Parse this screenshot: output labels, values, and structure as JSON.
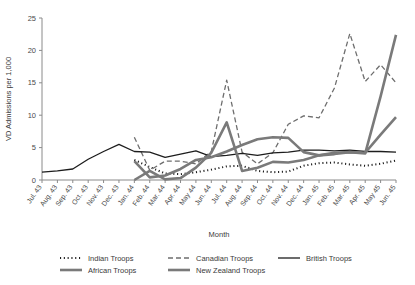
{
  "chart_data": {
    "type": "line",
    "title": "",
    "xlabel": "Month",
    "ylabel": "VD Admissions per 1,000",
    "ylim": [
      0,
      25
    ],
    "yticks": [
      0,
      5,
      10,
      15,
      20,
      25
    ],
    "grid": false,
    "legend_position": "bottom",
    "categories": [
      "Jul. 43",
      "Aug. 43",
      "Sep. 43",
      "Oct. 43",
      "Nov. 43",
      "Dec. 43",
      "Jan. 44",
      "Feb. 44",
      "Mar. 44",
      "Apr. 44",
      "May 44",
      "Jun. 44",
      "Jul. 44",
      "Aug. 44",
      "Sep. 44",
      "Oct. 44",
      "Nov. 44",
      "Dec. 44",
      "Jan. 45",
      "Feb. 45",
      "Mar. 45",
      "Apr. 45",
      "May 45",
      "Jun. 45"
    ],
    "series": [
      {
        "name": "Indian Troops",
        "style": "dotted",
        "color": "#1d1d1d",
        "width": 2,
        "values": [
          null,
          null,
          null,
          null,
          null,
          null,
          3.1,
          2.0,
          1.0,
          0.9,
          1.2,
          1.6,
          2.1,
          2.2,
          1.4,
          1.2,
          1.3,
          2.2,
          2.6,
          2.7,
          2.4,
          2.2,
          2.5,
          3.0
        ]
      },
      {
        "name": "Canadian Troops",
        "style": "dashed",
        "color": "#6e6e6e",
        "width": 1.3,
        "values": [
          null,
          null,
          null,
          null,
          null,
          null,
          6.6,
          1.5,
          2.9,
          2.9,
          2.5,
          4.4,
          15.4,
          4.3,
          2.5,
          4.2,
          8.6,
          9.9,
          9.6,
          14.2,
          22.6,
          15.2,
          17.8,
          15.0
        ]
      },
      {
        "name": "British Troops",
        "style": "solid",
        "color": "#1d1d1d",
        "width": 1.3,
        "values": [
          1.2,
          1.4,
          1.7,
          3.2,
          4.4,
          5.5,
          4.4,
          4.3,
          3.5,
          4.0,
          4.5,
          3.6,
          3.8,
          4.1,
          3.8,
          4.2,
          4.3,
          4.6,
          4.6,
          4.5,
          4.6,
          4.4,
          4.4,
          4.3
        ]
      },
      {
        "name": "African Troops",
        "style": "solid",
        "color": "#7a7a7a",
        "width": 2.6,
        "values": [
          null,
          null,
          null,
          null,
          null,
          null,
          0.0,
          1.4,
          0.1,
          0.3,
          1.9,
          4.2,
          8.9,
          1.4,
          1.9,
          2.8,
          2.7,
          3.1,
          3.8,
          4.2,
          4.3,
          4.2,
          7.0,
          9.7
        ]
      },
      {
        "name": "New Zealand Troops",
        "style": "solid",
        "color": "#7a7a7a",
        "width": 2.6,
        "values": [
          null,
          null,
          null,
          null,
          null,
          null,
          2.9,
          0.4,
          0.7,
          1.7,
          3.1,
          3.5,
          4.4,
          5.4,
          6.3,
          6.6,
          6.5,
          4.3,
          3.8,
          4.0,
          4.3,
          4.1,
          12.9,
          22.4
        ]
      }
    ]
  },
  "legend": {
    "items": [
      {
        "label": "Indian Troops"
      },
      {
        "label": "Canadian Troops"
      },
      {
        "label": "British Troops"
      },
      {
        "label": "African Troops"
      },
      {
        "label": "New Zealand Troops"
      }
    ]
  }
}
